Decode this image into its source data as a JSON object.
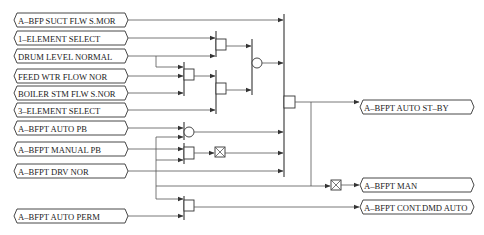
{
  "diagram": {
    "type": "logic-interlock",
    "inputs": [
      {
        "id": "in1",
        "label": "A–BFP SUCT FLW S.MOR"
      },
      {
        "id": "in2",
        "label": "1–ELEMENT SELECT"
      },
      {
        "id": "in3",
        "label": "DRUM LEVEL NORMAL"
      },
      {
        "id": "in4",
        "label": "FEED WTR FLOW NOR"
      },
      {
        "id": "in5",
        "label": "BOILER STM FLW S.NOR"
      },
      {
        "id": "in6",
        "label": "3–ELEMENT SELECT"
      },
      {
        "id": "in7",
        "label": "A–BFPT AUTO PB"
      },
      {
        "id": "in8",
        "label": "A–BFPT MANUAL PB"
      },
      {
        "id": "in9",
        "label": "A–BFPT DRV NOR"
      },
      {
        "id": "in10",
        "label": "A–BFPT AUTO PERM"
      }
    ],
    "outputs": [
      {
        "id": "out1",
        "label": "A–BFPT AUTO ST–BY"
      },
      {
        "id": "out2",
        "label": "A–BFPT MAN"
      },
      {
        "id": "out3",
        "label": "A–BFPT CONT.DMD AUTO"
      }
    ],
    "gates": [
      {
        "id": "and1",
        "kind": "AND",
        "inputs": [
          "in3",
          "in4",
          "in5"
        ]
      },
      {
        "id": "and2",
        "kind": "AND",
        "inputs": [
          "in2",
          "in3"
        ]
      },
      {
        "id": "and3",
        "kind": "AND",
        "inputs": [
          "and1",
          "in6"
        ]
      },
      {
        "id": "or1",
        "kind": "OR",
        "inputs": [
          "and2",
          "and3"
        ]
      },
      {
        "id": "or2",
        "kind": "OR",
        "inputs": [
          "in7",
          "in9"
        ]
      },
      {
        "id": "and4",
        "kind": "AND",
        "inputs": [
          "in8",
          "in9"
        ]
      },
      {
        "id": "mem1",
        "kind": "MEMORY/LATCH",
        "inputs": [
          "and4"
        ]
      },
      {
        "id": "and5",
        "kind": "AND",
        "inputs": [
          "in1",
          "or1",
          "or2",
          "mem1",
          "in9"
        ]
      },
      {
        "id": "mem2",
        "kind": "MEMORY/LATCH",
        "inputs": [
          "and5"
        ]
      },
      {
        "id": "and6",
        "kind": "AND",
        "inputs": [
          "in9",
          "in10"
        ]
      }
    ]
  }
}
